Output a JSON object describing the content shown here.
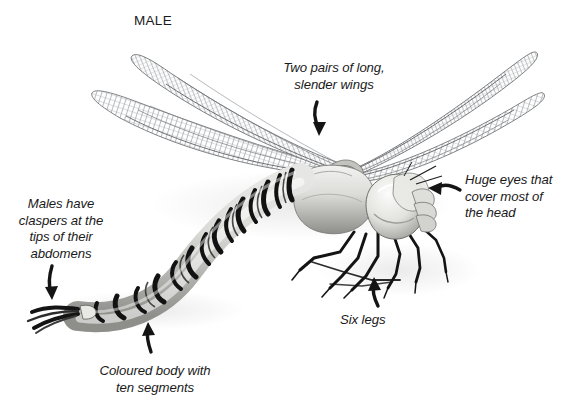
{
  "figure": {
    "sex_label": "MALE",
    "background_color": "#ffffff",
    "ink_color": "#1a1a1a",
    "style": "grayscale scientific illustration"
  },
  "annotations": [
    {
      "id": "wings",
      "text": "Two pairs of long,\nslender wings",
      "arrow": "down-curved-arrow"
    },
    {
      "id": "eyes",
      "text": "Huge eyes that\ncover most of\nthe head",
      "arrow": "left-curved-arrow"
    },
    {
      "id": "claspers",
      "text": "Males have\nclaspers at the\ntips of their\nabdomens",
      "arrow": "down-curved-arrow"
    },
    {
      "id": "body",
      "text": "Coloured body with\nten segments",
      "arrow": "up-curved-arrow"
    },
    {
      "id": "legs",
      "text": "Six legs",
      "arrow": "up-curved-arrow"
    }
  ],
  "parts": {
    "wing_fill": "#b9bcbe",
    "thorax_fill": "#d8d8d6",
    "abdomen_band": "#121212",
    "eye_fill": "#e6e6e4",
    "leg_stroke": "#141414",
    "shadow": "#c9c9c9"
  }
}
